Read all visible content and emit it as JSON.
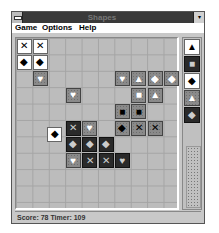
{
  "window": {
    "title": "Shapes",
    "maximize_glyph": "▾"
  },
  "menu": {
    "items": [
      "Game",
      "Options",
      "Help"
    ]
  },
  "board": {
    "columns": 10,
    "rows": 10,
    "tiles": [
      {
        "row": 0,
        "col": 0,
        "shape": "✕",
        "style": "white"
      },
      {
        "row": 0,
        "col": 1,
        "shape": "✕",
        "style": "white"
      },
      {
        "row": 1,
        "col": 0,
        "shape": "◆",
        "style": "white"
      },
      {
        "row": 1,
        "col": 1,
        "shape": "◆",
        "style": "white"
      },
      {
        "row": 2,
        "col": 1,
        "shape": "♥",
        "style": "gray"
      },
      {
        "row": 2,
        "col": 6,
        "shape": "♥",
        "style": "gray"
      },
      {
        "row": 2,
        "col": 7,
        "shape": "▲",
        "style": "gray"
      },
      {
        "row": 2,
        "col": 8,
        "shape": "◆",
        "style": "gray"
      },
      {
        "row": 2,
        "col": 9,
        "shape": "◆",
        "style": "gray"
      },
      {
        "row": 3,
        "col": 3,
        "shape": "♥",
        "style": "gray"
      },
      {
        "row": 3,
        "col": 7,
        "shape": "■",
        "style": "gray"
      },
      {
        "row": 3,
        "col": 8,
        "shape": "▲",
        "style": "gray"
      },
      {
        "row": 4,
        "col": 6,
        "shape": "■",
        "style": "gray-black"
      },
      {
        "row": 4,
        "col": 7,
        "shape": "■",
        "style": "gray-black"
      },
      {
        "row": 5,
        "col": 3,
        "shape": "✕",
        "style": "dark"
      },
      {
        "row": 5,
        "col": 4,
        "shape": "♥",
        "style": "gray"
      },
      {
        "row": 5,
        "col": 6,
        "shape": "◆",
        "style": "gray-black"
      },
      {
        "row": 5,
        "col": 7,
        "shape": "✕",
        "style": "gray-black"
      },
      {
        "row": 5,
        "col": 8,
        "shape": "✕",
        "style": "gray-black"
      },
      {
        "row": 6,
        "col": 3,
        "shape": "◆",
        "style": "dark"
      },
      {
        "row": 6,
        "col": 4,
        "shape": "◆",
        "style": "dark"
      },
      {
        "row": 6,
        "col": 5,
        "shape": "◆",
        "style": "dark"
      },
      {
        "row": 7,
        "col": 3,
        "shape": "♥",
        "style": "gray"
      },
      {
        "row": 7,
        "col": 4,
        "shape": "✕",
        "style": "dark"
      },
      {
        "row": 7,
        "col": 5,
        "shape": "✕",
        "style": "dark"
      },
      {
        "row": 7,
        "col": 6,
        "shape": "♥",
        "style": "dark"
      }
    ],
    "falling_piece": {
      "row": 5.4,
      "col": 1.9,
      "shape": "◆",
      "style": "white"
    }
  },
  "next_pieces": [
    {
      "shape": "▲",
      "style": "white"
    },
    {
      "shape": "■",
      "style": "dark"
    },
    {
      "shape": "◆",
      "style": "white"
    },
    {
      "shape": "▲",
      "style": "gray"
    },
    {
      "shape": "◆",
      "style": "dark"
    }
  ],
  "status": {
    "text": "Score: 78  Timer: 109",
    "score": 78,
    "timer": 109
  }
}
